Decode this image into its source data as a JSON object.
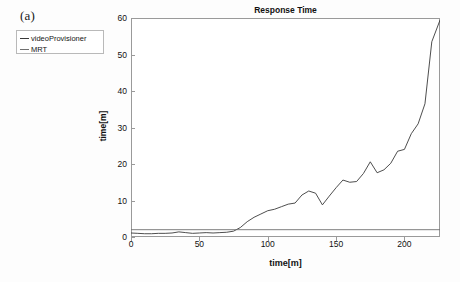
{
  "panel": {
    "label": "(a)"
  },
  "legend": {
    "items": [
      {
        "name": "videoProvisioner",
        "color": "#3a3a3a"
      },
      {
        "name": "MRT",
        "color": "#6f6f6f"
      }
    ]
  },
  "chart_data": {
    "type": "line",
    "title": "Response Time",
    "xlabel": "time[m]",
    "ylabel": "time[m]",
    "xlim": [
      0,
      226
    ],
    "ylim": [
      0,
      60
    ],
    "xticks": [
      0,
      50,
      100,
      150,
      200
    ],
    "yticks": [
      0,
      10,
      20,
      30,
      40,
      50,
      60
    ],
    "grid": false,
    "legend_position": "outside-top-left",
    "series": [
      {
        "name": "videoProvisioner",
        "color": "#3a3a3a",
        "x": [
          0,
          5,
          10,
          15,
          20,
          25,
          30,
          35,
          40,
          45,
          50,
          55,
          60,
          65,
          70,
          75,
          80,
          85,
          90,
          95,
          100,
          105,
          110,
          115,
          120,
          125,
          130,
          135,
          140,
          145,
          150,
          155,
          160,
          165,
          170,
          175,
          180,
          185,
          190,
          195,
          200,
          205,
          210,
          215,
          220,
          226
        ],
        "y": [
          1.1,
          1.0,
          0.9,
          0.9,
          1.0,
          1.0,
          1.1,
          1.4,
          1.2,
          1.0,
          1.1,
          1.2,
          1.1,
          1.2,
          1.3,
          1.6,
          2.6,
          4.2,
          5.4,
          6.3,
          7.2,
          7.6,
          8.3,
          9.0,
          9.3,
          11.5,
          12.6,
          12.0,
          8.8,
          11.2,
          13.5,
          15.6,
          15.0,
          15.2,
          17.4,
          20.6,
          17.6,
          18.4,
          20.2,
          23.5,
          24.0,
          28.3,
          31.0,
          36.5,
          53.5,
          59.4
        ]
      },
      {
        "name": "MRT",
        "color": "#6f6f6f",
        "x": [
          0,
          226
        ],
        "y": [
          2.0,
          2.0
        ]
      }
    ]
  }
}
